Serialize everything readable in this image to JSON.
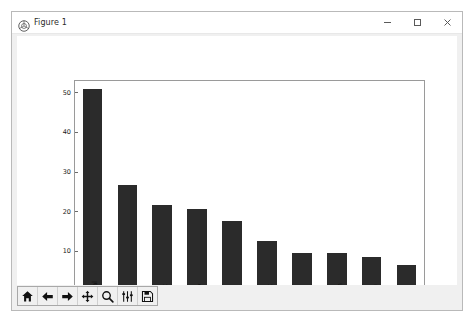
{
  "window": {
    "title": "Figure 1",
    "app_icon": "matplotlib-icon",
    "controls": {
      "minimize": "–",
      "maximize": "□",
      "close": "✕"
    }
  },
  "toolbar": {
    "buttons": [
      {
        "name": "home-icon",
        "tooltip": "Reset original view"
      },
      {
        "name": "back-arrow-icon",
        "tooltip": "Back to previous view"
      },
      {
        "name": "forward-arrow-icon",
        "tooltip": "Forward to next view"
      },
      {
        "name": "pan-move-icon",
        "tooltip": "Pan axes with left mouse, zoom with right"
      },
      {
        "name": "zoom-magnifier-icon",
        "tooltip": "Zoom to rectangle"
      },
      {
        "name": "configure-subplots-icon",
        "tooltip": "Configure subplots"
      },
      {
        "name": "save-disk-icon",
        "tooltip": "Save the figure"
      }
    ]
  },
  "chart_data": {
    "type": "bar",
    "title": "",
    "xlabel": "",
    "ylabel": "",
    "ylim": [
      0,
      53
    ],
    "yticks": [
      0,
      10,
      20,
      30,
      40,
      50
    ],
    "grid": false,
    "legend": null,
    "bar_color": "#2b2b2b",
    "xtick_rotation": 90,
    "categories": [
      "mmercial",
      "Noise",
      "idewalk",
      "riveway",
      "Parking",
      "mplaint",
      "Rodent",
      "ondition",
      "System",
      "Vehicle"
    ],
    "values": [
      51.0,
      26.8,
      21.8,
      20.8,
      17.7,
      12.6,
      9.7,
      9.6,
      8.7,
      6.5
    ]
  }
}
